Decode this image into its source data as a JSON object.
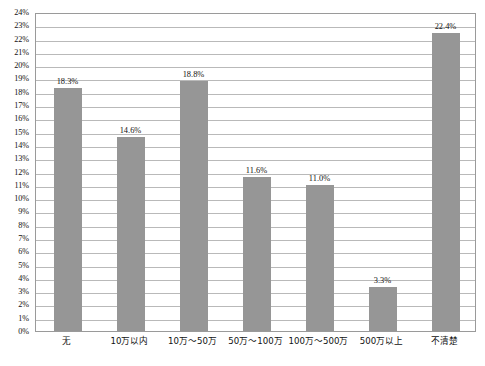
{
  "chart_data": {
    "type": "bar",
    "title": "",
    "subtitle": "",
    "xlabel": "",
    "ylabel": "",
    "categories": [
      "无",
      "10万以内",
      "10万～50万",
      "50万～100万",
      "100万～500万",
      "500万以上",
      "不清楚"
    ],
    "values": [
      18.3,
      14.6,
      18.8,
      11.6,
      11.0,
      3.3,
      22.4
    ],
    "value_labels": [
      "18.3%",
      "14.6%",
      "18.8%",
      "11.6%",
      "11.0%",
      "3.3%",
      "22.4%"
    ],
    "ylim": [
      0,
      24
    ],
    "ytick_step": 1,
    "ytick_labels": [
      "24%",
      "23%",
      "22%",
      "21%",
      "20%",
      "19%",
      "18%",
      "17%",
      "16%",
      "15%",
      "14%",
      "13%",
      "12%",
      "11%",
      "10%",
      "9%",
      "8%",
      "7%",
      "6%",
      "5%",
      "4%",
      "3%",
      "2%",
      "1%",
      "0%"
    ],
    "grid": "horizontal",
    "legend": "none",
    "series": [
      {
        "name": "占比",
        "values": [
          18.3,
          14.6,
          18.8,
          11.6,
          11.0,
          3.3,
          22.4
        ]
      }
    ],
    "colors": {
      "bar": "#969696",
      "gridline": "#b9b9b9",
      "frame": "#9a9a9a",
      "background": "#ffffff",
      "text": "#111111"
    }
  },
  "caption": {
    "text": ""
  }
}
